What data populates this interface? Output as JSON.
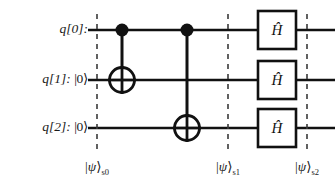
{
  "diagram": {
    "background_color": "#ffffff",
    "line_color": "#111111",
    "text_color": "#1a1a1a"
  },
  "qubits": [
    {
      "id": "q0",
      "name": "q[0]:",
      "ket": "",
      "wire_y": 30
    },
    {
      "id": "q1",
      "name": "q[1]:",
      "ket": "|0⟩",
      "wire_y": 80
    },
    {
      "id": "q2",
      "name": "q[2]:",
      "ket": "|0⟩",
      "wire_y": 128
    }
  ],
  "gates": [
    {
      "id": "cnot-0-1",
      "type": "cnot",
      "control_qubit": "q0",
      "target_qubit": "q1",
      "x": 122,
      "symbol": "control-dot + target-oplus"
    },
    {
      "id": "cnot-0-2",
      "type": "cnot",
      "control_qubit": "q0",
      "target_qubit": "q2",
      "x": 187,
      "symbol": "control-dot + target-oplus"
    },
    {
      "id": "h-q0",
      "type": "hadamard",
      "qubit": "q0",
      "x": 277,
      "label": "Ĥ"
    },
    {
      "id": "h-q1",
      "type": "hadamard",
      "qubit": "q1",
      "x": 277,
      "label": "Ĥ"
    },
    {
      "id": "h-q2",
      "type": "hadamard",
      "qubit": "q2",
      "x": 277,
      "label": "Ĥ"
    }
  ],
  "gate_label_text": {
    "h_letter": "H",
    "h_hat": "̂"
  },
  "barriers": [
    {
      "id": "barrier-s0",
      "x": 97,
      "label_ket_open": "|",
      "label_psi": "ψ",
      "label_ket_close": "⟩",
      "label_subscript": "s0",
      "label_y": 168
    },
    {
      "id": "barrier-s1",
      "x": 228,
      "label_ket_open": "|",
      "label_psi": "ψ",
      "label_ket_close": "⟩",
      "label_subscript": "s1",
      "label_y": 168
    },
    {
      "id": "barrier-s2",
      "x": 307,
      "label_ket_open": "|",
      "label_psi": "ψ",
      "label_ket_close": "⟩",
      "label_subscript": "s2",
      "label_y": 168
    }
  ],
  "geometry": {
    "wire_start_x": 88,
    "wire_end_x": 335,
    "gate_box_w": 38,
    "gate_box_h": 38,
    "control_dot_r": 6.5,
    "target_circle_r": 12
  }
}
